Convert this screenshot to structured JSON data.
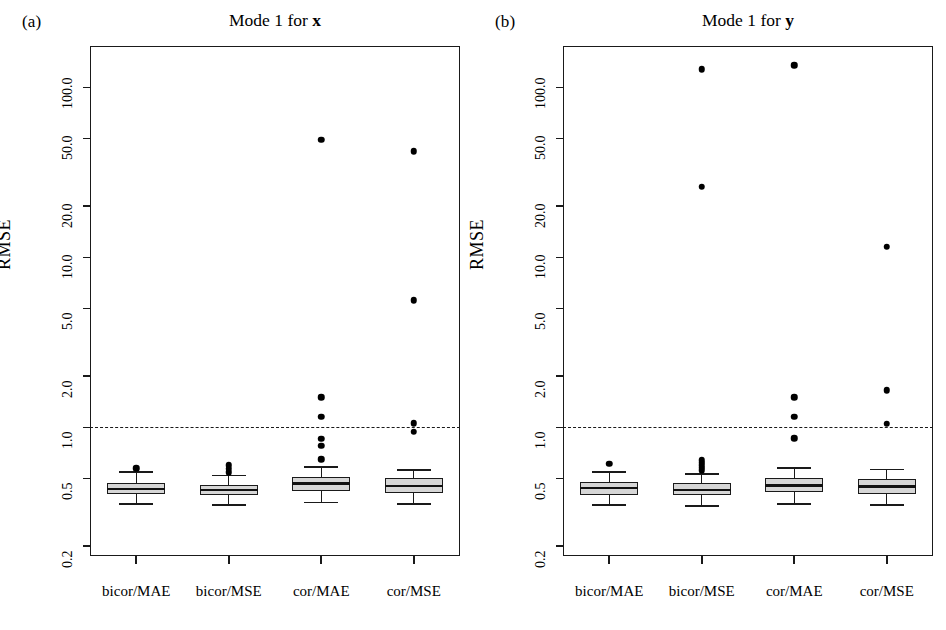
{
  "figure": {
    "width": 946,
    "height": 630,
    "background": "#ffffff",
    "ink_color": "#1a1a1a",
    "box_fill": "#d6d6d6"
  },
  "panels": [
    {
      "tag": "(a)",
      "title_prefix": "Mode 1 for ",
      "title_var": "x",
      "ylabel": "RMSE"
    },
    {
      "tag": "(b)",
      "title_prefix": "Mode 1 for ",
      "title_var": "y",
      "ylabel": "RMSE"
    }
  ],
  "chart_data": [
    {
      "type": "boxplot",
      "panel": "(a)",
      "title": "Mode 1 for x",
      "xlabel": "",
      "ylabel": "RMSE",
      "yscale": "log",
      "ylim": [
        0.175,
        175
      ],
      "yticks": [
        0.2,
        0.5,
        1.0,
        2.0,
        5.0,
        10.0,
        20.0,
        50.0,
        100.0
      ],
      "ytick_labels": [
        "0.2",
        "0.5",
        "1.0",
        "2.0",
        "5.0",
        "10.0",
        "20.0",
        "50.0",
        "100.0"
      ],
      "grid": false,
      "reference_line": {
        "y": 1.0,
        "style": "dashed"
      },
      "categories": [
        "bicor/MAE",
        "bicor/MSE",
        "cor/MAE",
        "cor/MSE"
      ],
      "boxes": [
        {
          "category": "bicor/MAE",
          "whisker_low": 0.355,
          "q1": 0.405,
          "median": 0.435,
          "q3": 0.47,
          "whisker_high": 0.545,
          "outliers": [
            0.575
          ]
        },
        {
          "category": "bicor/MSE",
          "whisker_low": 0.35,
          "q1": 0.4,
          "median": 0.428,
          "q3": 0.458,
          "whisker_high": 0.52,
          "outliers": [
            0.545,
            0.57,
            0.6
          ]
        },
        {
          "category": "cor/MAE",
          "whisker_low": 0.36,
          "q1": 0.42,
          "median": 0.468,
          "q3": 0.512,
          "whisker_high": 0.585,
          "outliers": [
            0.65,
            0.78,
            0.855,
            1.15,
            1.5,
            49.0
          ]
        },
        {
          "category": "cor/MSE",
          "whisker_low": 0.355,
          "q1": 0.41,
          "median": 0.45,
          "q3": 0.5,
          "whisker_high": 0.56,
          "outliers": [
            0.94,
            1.06,
            5.6,
            42.0
          ]
        }
      ]
    },
    {
      "type": "boxplot",
      "panel": "(b)",
      "title": "Mode 1 for y",
      "xlabel": "",
      "ylabel": "RMSE",
      "yscale": "log",
      "ylim": [
        0.175,
        175
      ],
      "yticks": [
        0.2,
        0.5,
        1.0,
        2.0,
        5.0,
        10.0,
        20.0,
        50.0,
        100.0
      ],
      "ytick_labels": [
        "0.2",
        "0.5",
        "1.0",
        "2.0",
        "5.0",
        "10.0",
        "20.0",
        "50.0",
        "100.0"
      ],
      "grid": false,
      "reference_line": {
        "y": 1.0,
        "style": "dashed"
      },
      "categories": [
        "bicor/MAE",
        "bicor/MSE",
        "cor/MAE",
        "cor/MSE"
      ],
      "boxes": [
        {
          "category": "bicor/MAE",
          "whisker_low": 0.35,
          "q1": 0.4,
          "median": 0.44,
          "q3": 0.48,
          "whisker_high": 0.545,
          "outliers": [
            0.61
          ]
        },
        {
          "category": "bicor/MSE",
          "whisker_low": 0.345,
          "q1": 0.4,
          "median": 0.428,
          "q3": 0.468,
          "whisker_high": 0.53,
          "outliers": [
            0.56,
            0.58,
            0.6,
            0.62,
            0.64,
            128.0,
            26.0
          ]
        },
        {
          "category": "cor/MAE",
          "whisker_low": 0.355,
          "q1": 0.415,
          "median": 0.455,
          "q3": 0.5,
          "whisker_high": 0.575,
          "outliers": [
            0.86,
            1.15,
            1.5,
            135.0
          ]
        },
        {
          "category": "cor/MSE",
          "whisker_low": 0.35,
          "q1": 0.405,
          "median": 0.448,
          "q3": 0.495,
          "whisker_high": 0.565,
          "outliers": [
            1.05,
            1.65,
            11.5
          ]
        }
      ]
    }
  ]
}
